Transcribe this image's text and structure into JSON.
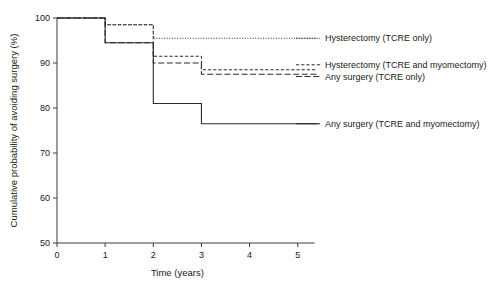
{
  "chart_data": {
    "type": "line",
    "title": "",
    "xlabel": "Time (years)",
    "ylabel": "Cumulative probability of avoiding surgery (%)",
    "xlim": [
      0,
      5.4
    ],
    "ylim": [
      50,
      100
    ],
    "xticks": [
      "0",
      "1",
      "2",
      "3",
      "4",
      "5"
    ],
    "xtick_values": [
      0,
      1,
      2,
      3,
      4,
      5
    ],
    "yticks": [
      "50",
      "60",
      "70",
      "80",
      "90",
      "100"
    ],
    "ytick_values": [
      50,
      60,
      70,
      80,
      90,
      100
    ],
    "grid": false,
    "legend_position": "right-inline",
    "step_type": "post",
    "series": [
      {
        "name": "Hysterectomy (TCRE only)",
        "style": "dotted",
        "x": [
          0,
          1,
          2,
          5.4
        ],
        "y": [
          100,
          98.5,
          95.5,
          95.5
        ],
        "label_y": 95.5
      },
      {
        "name": "Hysterectomy (TCRE and myomectomy)",
        "style": "short-dash",
        "x": [
          0,
          1,
          2,
          3,
          5.4
        ],
        "y": [
          100,
          98.5,
          91.5,
          88.5,
          88.5
        ],
        "label_y": 89.6
      },
      {
        "name": "Any surgery (TCRE only)",
        "style": "long-dash",
        "x": [
          0,
          1,
          2,
          3,
          5.4
        ],
        "y": [
          100,
          94.5,
          90,
          87.5,
          87.5
        ],
        "label_y": 87.0
      },
      {
        "name": "Any surgery (TCRE and myomectomy)",
        "style": "solid",
        "x": [
          0,
          1,
          2,
          3,
          5.4
        ],
        "y": [
          100,
          94.5,
          81,
          76.5,
          76.5
        ],
        "label_y": 76.5
      }
    ]
  }
}
